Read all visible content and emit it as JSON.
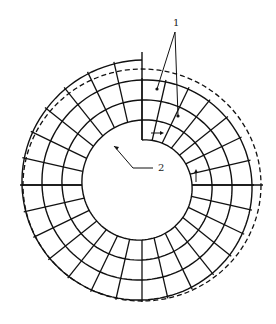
{
  "diagram": {
    "type": "spiral-wound annular grid (cross-section)",
    "center": [
      142,
      185
    ],
    "outer_dashed_radius": [
      119,
      116
    ],
    "ring_radii": [
      109,
      87,
      65
    ],
    "hole_radius_start": 45,
    "hole_radius_end": 65,
    "radial_spoke_count": 28,
    "stroke_color": "#111111",
    "background": "#ffffff",
    "labels": [
      {
        "id": "1",
        "text": "1",
        "x": 173,
        "y": 26
      },
      {
        "id": "2",
        "text": "2",
        "x": 158,
        "y": 171
      }
    ],
    "leaders": [
      {
        "label": "1",
        "from": [
          175,
          32
        ],
        "to": [
          157,
          89
        ]
      },
      {
        "label": "1",
        "from": [
          175,
          32
        ],
        "to": [
          178,
          116
        ]
      },
      {
        "label": "2",
        "from": [
          153,
          168
        ],
        "to": [
          133,
          168
        ],
        "via": [
          114,
          146
        ]
      }
    ],
    "flow_arrows": [
      {
        "at": [
          158,
          133
        ],
        "direction": "right"
      },
      {
        "at": [
          196,
          174
        ],
        "direction": "up"
      }
    ]
  }
}
